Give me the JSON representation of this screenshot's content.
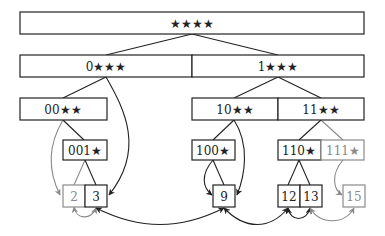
{
  "diagram": {
    "colors": {
      "dark": "#222222",
      "gray": "#8a8a8a"
    },
    "nodes": {
      "root": {
        "label": "★★★★"
      },
      "n0": {
        "label": "0★★★"
      },
      "n1": {
        "label": "1★★★"
      },
      "n00": {
        "label": "00★★"
      },
      "n10": {
        "label": "10★★"
      },
      "n11": {
        "label": "11★★"
      },
      "n001": {
        "label": "001★"
      },
      "n100": {
        "label": "100★"
      },
      "n110": {
        "label": "110★"
      },
      "n111": {
        "label": "111★"
      },
      "l2": {
        "label": "2"
      },
      "l3": {
        "label": "3"
      },
      "l9": {
        "label": "9"
      },
      "l12": {
        "label": "12"
      },
      "l13": {
        "label": "13"
      },
      "l15": {
        "label": "15"
      }
    }
  }
}
